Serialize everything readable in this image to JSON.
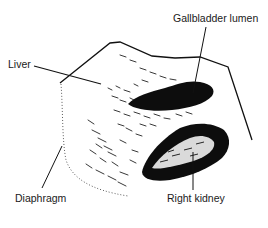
{
  "figure": {
    "type": "ultrasound-line-drawing",
    "labels": {
      "liver": "Liver",
      "gallbladder": "Gallbladder lumen",
      "diaphragm": "Diaphragm",
      "kidney": "Right kidney"
    },
    "colors": {
      "ink": "#111111",
      "background": "#ffffff"
    }
  }
}
